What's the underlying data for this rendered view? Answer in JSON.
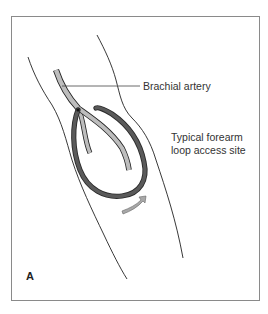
{
  "figure": {
    "panel_letter": "A",
    "labels": {
      "artery": "Brachial artery",
      "site_line1": "Typical forearm",
      "site_line2": "loop access site"
    },
    "colors": {
      "frame": "#8a8a8a",
      "outline": "#222222",
      "artery_fill": "#bdbdbd",
      "loop_graft": "#555555",
      "flow_arrow": "#a8a8a8",
      "text": "#333333"
    },
    "icons": {
      "flow_arrow": "curved-arrow-icon"
    }
  }
}
